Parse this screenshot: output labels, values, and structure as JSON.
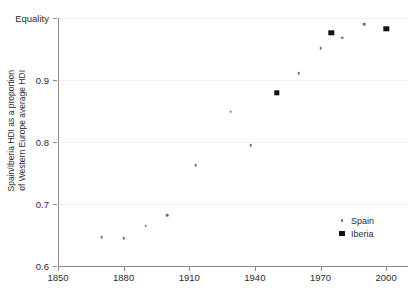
{
  "chart_data": {
    "type": "scatter",
    "title": "",
    "xlabel": "",
    "ylabel_line1": "Spain/Iberia HDI as a proportion",
    "ylabel_line2": "of Western Europe average HDI",
    "xlim": [
      1850,
      2010
    ],
    "ylim": [
      0.6,
      1.0
    ],
    "grid": true,
    "legend_position": "bottom-right",
    "xticks": [
      1850,
      1880,
      1910,
      1940,
      1970,
      2000
    ],
    "xtick_labels": [
      "1850",
      "1880",
      "1910",
      "1940",
      "1970",
      "2000"
    ],
    "yticks": [
      0.6,
      0.7,
      0.8,
      0.9,
      1.0
    ],
    "ytick_labels": [
      "0.6",
      "0.7",
      "0.8",
      "0.9",
      "Equality"
    ],
    "series": [
      {
        "name": "Spain",
        "marker": "dot",
        "color": "#6e6e6e",
        "points": [
          {
            "x": 1870,
            "y": 0.646
          },
          {
            "x": 1880,
            "y": 0.645
          },
          {
            "x": 1890,
            "y": 0.665
          },
          {
            "x": 1900,
            "y": 0.682
          },
          {
            "x": 1913,
            "y": 0.763
          },
          {
            "x": 1929,
            "y": 0.849
          },
          {
            "x": 1938,
            "y": 0.795
          },
          {
            "x": 1960,
            "y": 0.911
          },
          {
            "x": 1970,
            "y": 0.951
          },
          {
            "x": 1975,
            "y": 0.975
          },
          {
            "x": 1980,
            "y": 0.968
          },
          {
            "x": 1990,
            "y": 0.99
          },
          {
            "x": 2000,
            "y": 0.984
          }
        ]
      },
      {
        "name": "Iberia",
        "marker": "square",
        "color": "#111111",
        "points": [
          {
            "x": 1950,
            "y": 0.879
          },
          {
            "x": 1975,
            "y": 0.976
          },
          {
            "x": 2000,
            "y": 0.983
          }
        ]
      }
    ]
  },
  "legend": {
    "entries": [
      {
        "label": "Spain",
        "marker": "dot"
      },
      {
        "label": "Iberia",
        "marker": "square"
      }
    ]
  }
}
